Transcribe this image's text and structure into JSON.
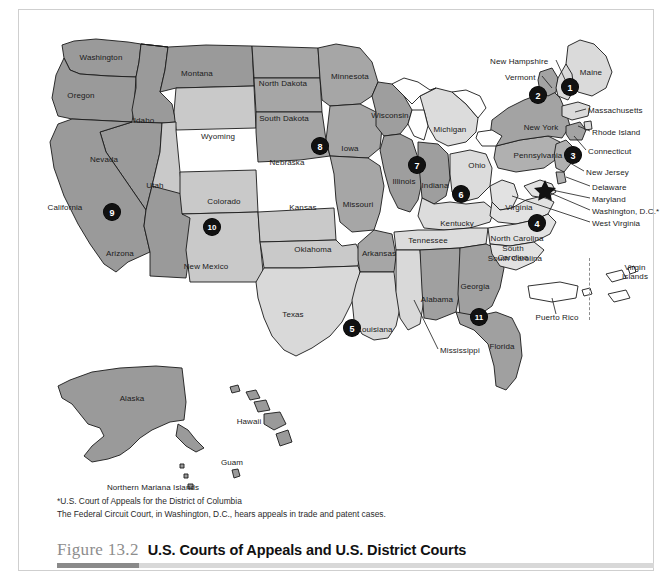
{
  "figure": {
    "number": "Figure 13.2",
    "title": "U.S. Courts of Appeals and U.S. District Courts"
  },
  "notes": [
    "*U.S. Court of Appeals for the District of Columbia",
    "The Federal Circuit Court, in Washington, D.C., hears appeals in trade and patent cases."
  ],
  "colors": {
    "circuit_dark": "#9a9a9a",
    "circuit_light": "#d6d6d6",
    "circuit_mid": "#b5b5b5",
    "badge": "#111111",
    "outline": "#1a1a1a",
    "caption_number": "#8d8d8d",
    "accent_dark": "#8a8a8a",
    "accent_light": "#d8d8d8"
  },
  "map": {
    "title": "U.S. Courts of Appeals and U.S. District Courts",
    "star_marker": "washington-dc-star",
    "circuits": [
      {
        "number": "1",
        "x": 570,
        "y": 87
      },
      {
        "number": "2",
        "x": 538,
        "y": 95
      },
      {
        "number": "3",
        "x": 573,
        "y": 155
      },
      {
        "number": "4",
        "x": 537,
        "y": 223
      },
      {
        "number": "5",
        "x": 352,
        "y": 328
      },
      {
        "number": "6",
        "x": 461,
        "y": 194
      },
      {
        "number": "7",
        "x": 417,
        "y": 165
      },
      {
        "number": "8",
        "x": 320,
        "y": 146
      },
      {
        "number": "9",
        "x": 112,
        "y": 212
      },
      {
        "number": "10",
        "x": 212,
        "y": 227
      },
      {
        "number": "11",
        "x": 479,
        "y": 317
      }
    ],
    "inline_labels": [
      {
        "text": "Washington",
        "x": 101,
        "y": 58
      },
      {
        "text": "Oregon",
        "x": 81,
        "y": 96
      },
      {
        "text": "Idaho",
        "x": 144,
        "y": 121
      },
      {
        "text": "Montana",
        "x": 197,
        "y": 74
      },
      {
        "text": "Wyoming",
        "x": 218,
        "y": 137
      },
      {
        "text": "Nevada",
        "x": 104,
        "y": 160
      },
      {
        "text": "Utah",
        "x": 155,
        "y": 186
      },
      {
        "text": "California",
        "x": 65,
        "y": 208
      },
      {
        "text": "Arizona",
        "x": 120,
        "y": 254
      },
      {
        "text": "Colorado",
        "x": 224,
        "y": 202
      },
      {
        "text": "New Mexico",
        "x": 206,
        "y": 267
      },
      {
        "text": "North Dakota",
        "x": 283,
        "y": 84
      },
      {
        "text": "South Dakota",
        "x": 284,
        "y": 119
      },
      {
        "text": "Nebraska",
        "x": 287,
        "y": 163
      },
      {
        "text": "Kansas",
        "x": 303,
        "y": 208
      },
      {
        "text": "Oklahoma",
        "x": 313,
        "y": 250
      },
      {
        "text": "Texas",
        "x": 293,
        "y": 315
      },
      {
        "text": "Minnesota",
        "x": 350,
        "y": 77
      },
      {
        "text": "Iowa",
        "x": 350,
        "y": 149
      },
      {
        "text": "Missouri",
        "x": 358,
        "y": 205
      },
      {
        "text": "Arkansas",
        "x": 379,
        "y": 254
      },
      {
        "text": "Louisiana",
        "x": 375,
        "y": 330
      },
      {
        "text": "Wisconsin",
        "x": 390,
        "y": 116
      },
      {
        "text": "Illinois",
        "x": 404,
        "y": 182
      },
      {
        "text": "Indiana",
        "x": 435,
        "y": 186
      },
      {
        "text": "Michigan",
        "x": 450,
        "y": 130
      },
      {
        "text": "Ohio",
        "x": 477,
        "y": 166
      },
      {
        "text": "Kentucky",
        "x": 457,
        "y": 224
      },
      {
        "text": "Tennessee",
        "x": 428,
        "y": 241
      },
      {
        "text": "Alabama",
        "x": 437,
        "y": 300
      },
      {
        "text": "Georgia",
        "x": 475,
        "y": 287
      },
      {
        "text": "Florida",
        "x": 502,
        "y": 347
      },
      {
        "text": "Virginia",
        "x": 519,
        "y": 208
      },
      {
        "text": "North Carolina",
        "x": 517,
        "y": 239
      },
      {
        "text": "South Carolina",
        "x": 515,
        "y": 259
      },
      {
        "text": "New York",
        "x": 541,
        "y": 128
      },
      {
        "text": "Pennsylvania",
        "x": 538,
        "y": 156
      },
      {
        "text": "Maine",
        "x": 591,
        "y": 73
      },
      {
        "text": "Alaska",
        "x": 132,
        "y": 399
      },
      {
        "text": "Hawaii",
        "x": 249,
        "y": 422
      },
      {
        "text": "Guam",
        "x": 232,
        "y": 463
      },
      {
        "text": "Puerto Rico",
        "x": 557,
        "y": 318
      }
    ],
    "multiline_labels": [
      {
        "lines": [
          "South",
          "Carolina"
        ],
        "x": 513,
        "y": 253
      },
      {
        "lines": [
          "Virgin",
          "Islands"
        ],
        "x": 635,
        "y": 272
      },
      {
        "lines": [
          "Northern Mariana Islands"
        ],
        "x": 153,
        "y": 487
      }
    ],
    "leader_labels": [
      {
        "text": "New Hampshire",
        "x": 490,
        "y": 62,
        "anchor": "start"
      },
      {
        "text": "Vermont",
        "x": 505,
        "y": 78,
        "anchor": "start"
      },
      {
        "text": "Massachusetts",
        "x": 588,
        "y": 111,
        "anchor": "start"
      },
      {
        "text": "Rhode Island",
        "x": 592,
        "y": 133,
        "anchor": "start"
      },
      {
        "text": "Connecticut",
        "x": 588,
        "y": 152,
        "anchor": "start"
      },
      {
        "text": "New Jersey",
        "x": 586,
        "y": 173,
        "anchor": "start"
      },
      {
        "text": "Delaware",
        "x": 592,
        "y": 188,
        "anchor": "start"
      },
      {
        "text": "Maryland",
        "x": 592,
        "y": 200,
        "anchor": "start"
      },
      {
        "text": "Washington, D.C.*",
        "x": 592,
        "y": 212,
        "anchor": "start"
      },
      {
        "text": "West Virginia",
        "x": 592,
        "y": 224,
        "anchor": "start"
      },
      {
        "text": "Mississippi",
        "x": 440,
        "y": 351,
        "anchor": "start"
      }
    ]
  }
}
